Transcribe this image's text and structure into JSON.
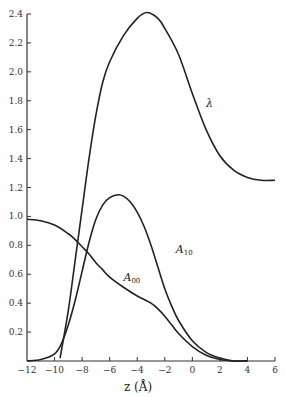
{
  "chart_data": {
    "type": "line",
    "title": "",
    "xlabel": "z (Å)",
    "ylabel": "",
    "xlim": [
      -12,
      6
    ],
    "ylim": [
      0,
      2.4
    ],
    "grid": false,
    "legend": "inline curve labels",
    "x_ticks": [
      "−12",
      "−10",
      "−8",
      "−6",
      "−4",
      "−2",
      "0",
      "2",
      "4",
      "6"
    ],
    "y_ticks": [
      "0.2",
      "0.4",
      "0.6",
      "0.8",
      "1.0",
      "1.2",
      "1.4",
      "1.6",
      "1.8",
      "2.0",
      "2.2",
      "2.4"
    ],
    "series": [
      {
        "name": "λ",
        "label": "λ",
        "x": [
          -9.6,
          -9,
          -8.5,
          -8,
          -7.5,
          -7,
          -6.5,
          -6,
          -5,
          -4,
          -3.3,
          -2.5,
          -2,
          -1,
          0,
          1,
          2,
          3,
          4,
          5,
          6
        ],
        "y": [
          0.02,
          0.35,
          0.7,
          1.05,
          1.4,
          1.7,
          1.93,
          2.07,
          2.25,
          2.37,
          2.41,
          2.37,
          2.3,
          2.12,
          1.85,
          1.6,
          1.42,
          1.32,
          1.27,
          1.25,
          1.25
        ]
      },
      {
        "name": "A10",
        "label": "A",
        "label_sub": "10",
        "x": [
          -12,
          -11,
          -10,
          -9.5,
          -9,
          -8.5,
          -8,
          -7.5,
          -7,
          -6.5,
          -6,
          -5.4,
          -5,
          -4.5,
          -4,
          -3.5,
          -3,
          -2.5,
          -2,
          -1.5,
          -1,
          0,
          1,
          2,
          3,
          4
        ],
        "y": [
          0.0,
          0.01,
          0.05,
          0.12,
          0.25,
          0.42,
          0.62,
          0.82,
          0.98,
          1.08,
          1.13,
          1.15,
          1.14,
          1.1,
          1.03,
          0.93,
          0.8,
          0.65,
          0.5,
          0.38,
          0.28,
          0.14,
          0.06,
          0.02,
          0.0,
          0.0
        ]
      },
      {
        "name": "A00",
        "label": "A",
        "label_sub": "00",
        "x": [
          -12,
          -11,
          -10,
          -9,
          -8.5,
          -8,
          -7.5,
          -7,
          -6.5,
          -6,
          -5,
          -4,
          -3,
          -2.5,
          -2,
          -1.5,
          -1,
          0,
          1,
          2,
          3,
          4
        ],
        "y": [
          0.98,
          0.97,
          0.94,
          0.88,
          0.84,
          0.79,
          0.74,
          0.68,
          0.63,
          0.58,
          0.51,
          0.45,
          0.4,
          0.36,
          0.31,
          0.25,
          0.19,
          0.1,
          0.04,
          0.01,
          0.0,
          0.0
        ]
      }
    ],
    "annotations": [
      {
        "text": "λ",
        "x": 1.0,
        "y": 1.76
      },
      {
        "text": "A10",
        "x": -1.2,
        "y": 0.75
      },
      {
        "text": "A00",
        "x": -5.0,
        "y": 0.55
      }
    ]
  },
  "plot": {
    "left_px": 27,
    "right_px": 275,
    "top_px": 14,
    "bottom_px": 361
  },
  "labels": {
    "x_axis_title": "z (Å)",
    "lambda": "λ",
    "a10_main": "A",
    "a10_sub": "10",
    "a00_main": "A",
    "a00_sub": "00"
  }
}
